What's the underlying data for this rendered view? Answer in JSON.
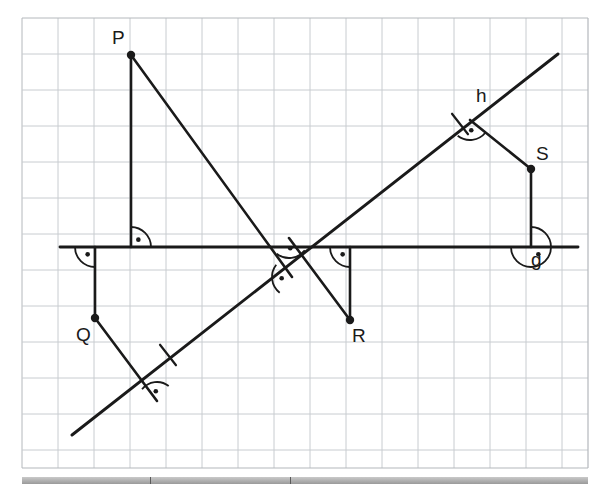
{
  "figure": {
    "kind": "geometry-construction",
    "background": "#ffffff",
    "grid": {
      "color": "#c8ccd0",
      "border_color": "#b4b8bc",
      "spacing_px": 36,
      "x0": 22,
      "y0": 18,
      "x1": 588,
      "y1": 468,
      "cols": 16,
      "rows": 13
    },
    "ink_color": "#1a1a1a",
    "line_width": 2.6
  },
  "lines": [
    {
      "name": "g",
      "label": "g",
      "label_x": 531,
      "label_y": 250,
      "x1": 60,
      "y1": 247,
      "x2": 578,
      "y2": 247
    },
    {
      "name": "h",
      "label": "h",
      "label_x": 476,
      "label_y": 86,
      "x1": 72,
      "y1": 435,
      "x2": 558,
      "y2": 54
    }
  ],
  "points": [
    {
      "name": "P",
      "label": "P",
      "x": 131,
      "y": 55,
      "label_x": 112,
      "label_y": 28
    },
    {
      "name": "Q",
      "label": "Q",
      "x": 95,
      "y": 318,
      "label_x": 76,
      "label_y": 325
    },
    {
      "name": "R",
      "label": "R",
      "x": 350,
      "y": 320,
      "label_x": 352,
      "label_y": 326
    },
    {
      "name": "S",
      "label": "S",
      "x": 531,
      "y": 169,
      "label_x": 536,
      "label_y": 144
    }
  ],
  "segments": [
    {
      "name": "P-to-g-perpendicular",
      "x1": 131,
      "y1": 55,
      "x2": 131,
      "y2": 247
    },
    {
      "name": "P-to-h-perpendicular",
      "x1": 131,
      "y1": 55,
      "x2": 292,
      "y2": 277
    },
    {
      "name": "Q-to-g-perpendicular",
      "x1": 95,
      "y1": 318,
      "x2": 95,
      "y2": 247
    },
    {
      "name": "Q-to-h-perpendicular",
      "x1": 95,
      "y1": 318,
      "x2": 157,
      "y2": 401
    },
    {
      "name": "R-to-g-perpendicular",
      "x1": 350,
      "y1": 320,
      "x2": 350,
      "y2": 247
    },
    {
      "name": "R-to-h-perpendicular",
      "x1": 350,
      "y1": 320,
      "x2": 289,
      "y2": 238
    },
    {
      "name": "S-to-g-perpendicular",
      "x1": 531,
      "y1": 169,
      "x2": 531,
      "y2": 247
    },
    {
      "name": "S-to-h-perpendicular",
      "x1": 531,
      "y1": 169,
      "x2": 470,
      "y2": 120
    }
  ],
  "right_angle_marks": [
    {
      "name": "right-angle-at-P-foot-on-g",
      "x": 131,
      "y": 247,
      "a1": -90,
      "a2": 0,
      "r": 20
    },
    {
      "name": "right-angle-at-Q-foot-on-g",
      "x": 95,
      "y": 247,
      "a1": 90,
      "a2": 180,
      "r": 20
    },
    {
      "name": "right-angle-at-R-foot-on-g",
      "x": 350,
      "y": 247,
      "a1": 90,
      "a2": 180,
      "r": 20
    },
    {
      "name": "right-angle-at-S-foot-on-g",
      "x": 531,
      "y": 247,
      "a1": -90,
      "a2": 180,
      "r": 20
    },
    {
      "name": "right-angle-at-P-foot-on-h",
      "x": 292,
      "y": 277,
      "a1": 128,
      "a2": 218,
      "r": 20
    },
    {
      "name": "right-angle-at-Q-foot-on-h",
      "x": 157,
      "y": 401,
      "a1": 218,
      "a2": 308,
      "r": 19
    },
    {
      "name": "right-angle-at-R-foot-on-h",
      "x": 289,
      "y": 238,
      "a1": 38,
      "a2": 128,
      "r": 20
    },
    {
      "name": "right-angle-at-S-foot-on-h",
      "x": 470,
      "y": 120,
      "a1": 38,
      "a2": 128,
      "r": 20
    }
  ],
  "tick_marks": [
    {
      "name": "congruence-tick-lower-left",
      "x": 168,
      "y": 355,
      "angle": 38,
      "len": 26
    },
    {
      "name": "congruence-tick-upper-right",
      "x": 460,
      "y": 124,
      "angle": 38,
      "len": 26
    }
  ],
  "footer": {
    "divider_positions": [
      150,
      290
    ],
    "bar_x": 22,
    "bar_width": 566
  }
}
